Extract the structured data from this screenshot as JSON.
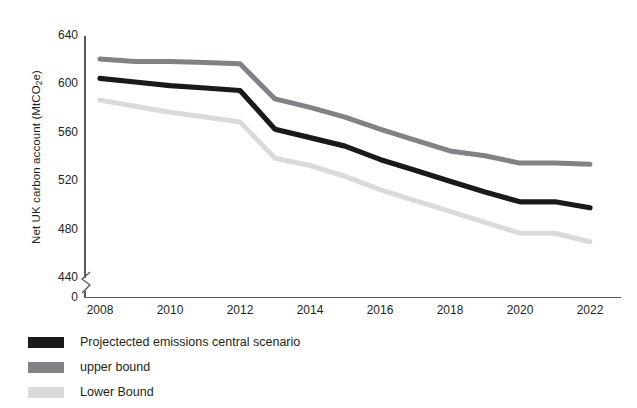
{
  "chart_data": {
    "type": "line",
    "title": "",
    "xlabel": "",
    "ylabel_parts": {
      "pre": "Net UK carbon account (MtCO",
      "sub": "2",
      "post": "e)"
    },
    "ylabel": "Net UK carbon account (MtCO2e)",
    "x": [
      2008,
      2009,
      2010,
      2011,
      2012,
      2013,
      2014,
      2015,
      2016,
      2017,
      2018,
      2019,
      2020,
      2021,
      2022
    ],
    "xlim": [
      2008,
      2022
    ],
    "ylim": [
      440,
      640
    ],
    "y_axis_break": true,
    "y_axis_break_from": 0,
    "y_axis_break_to": 440,
    "grid": false,
    "legend_position": "below-left",
    "xticks": [
      "2008",
      "2010",
      "2012",
      "2014",
      "2016",
      "2018",
      "2020",
      "2022"
    ],
    "xtick_values": [
      2008,
      2010,
      2012,
      2014,
      2016,
      2018,
      2020,
      2022
    ],
    "yticks": [
      "640",
      "600",
      "560",
      "520",
      "480",
      "440",
      "0"
    ],
    "ytick_values": [
      640,
      600,
      560,
      520,
      480,
      440,
      0
    ],
    "series": [
      {
        "name": "Projectected emissions central scenario",
        "color": "#1a1a1a",
        "values": [
          605,
          602,
          599,
          597,
          595,
          563,
          556,
          549,
          538,
          529,
          520,
          511,
          503,
          503,
          498
        ]
      },
      {
        "name": "upper bound",
        "color": "#808285",
        "values": [
          621,
          619,
          619,
          618,
          617,
          588,
          581,
          573,
          563,
          554,
          545,
          541,
          535,
          535,
          534
        ]
      },
      {
        "name": "Lower Bound",
        "color": "#d9dadb",
        "values": [
          587,
          582,
          577,
          573,
          569,
          539,
          533,
          524,
          513,
          504,
          495,
          486,
          477,
          477,
          470
        ]
      }
    ]
  },
  "legend": {
    "items": [
      {
        "label": "Projectected emissions central scenario",
        "color": "#1a1a1a"
      },
      {
        "label": "upper bound",
        "color": "#808285"
      },
      {
        "label": "Lower Bound",
        "color": "#d9dadb"
      }
    ]
  }
}
